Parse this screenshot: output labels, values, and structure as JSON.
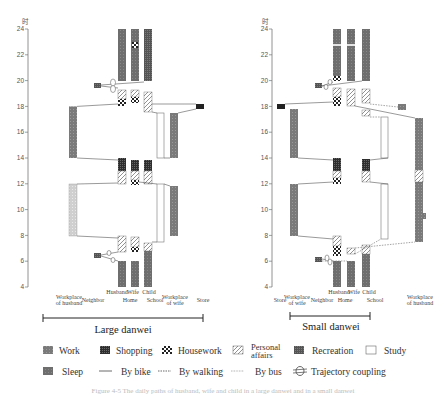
{
  "y_axis": {
    "unit_label": "时",
    "ticks": [
      24,
      22,
      20,
      18,
      16,
      14,
      12,
      10,
      8,
      6,
      4
    ],
    "range": [
      4,
      24
    ]
  },
  "panels": [
    {
      "id": "large",
      "title": "Large danwei",
      "axis_x": 28,
      "locations": [
        {
          "label": "Workplace of husband",
          "lines": [
            "Workplace",
            "of husband"
          ],
          "x": 69
        },
        {
          "label": "Neighbor",
          "lines": [
            "Neighbor"
          ],
          "x": 93
        },
        {
          "label": "Home",
          "lines": [
            "Home"
          ],
          "x": 130
        },
        {
          "label": "School",
          "lines": [
            "School"
          ],
          "x": 155
        },
        {
          "label": "Workplace of wife",
          "lines": [
            "Workplace",
            "of wife"
          ],
          "x": 175
        },
        {
          "label": "Store",
          "lines": [
            "Store"
          ],
          "x": 203
        }
      ],
      "members": [
        {
          "label": "Husband",
          "x": 117
        },
        {
          "label": "Wife",
          "x": 133
        },
        {
          "label": "Child",
          "x": 149
        }
      ],
      "bracket": [
        43,
        203
      ]
    },
    {
      "id": "small",
      "title": "Small danwei",
      "axis_x": 272,
      "locations": [
        {
          "label": "Store",
          "lines": [
            "Store"
          ],
          "x": 280
        },
        {
          "label": "Workplace of wife",
          "lines": [
            "Workplace",
            "of wife"
          ],
          "x": 297
        },
        {
          "label": "Neighbor",
          "lines": [
            "Neighbor"
          ],
          "x": 322
        },
        {
          "label": "Home",
          "lines": [
            "Home"
          ],
          "x": 345
        },
        {
          "label": "School",
          "lines": [
            "School"
          ],
          "x": 375
        },
        {
          "label": "Workplace of husband",
          "lines": [
            "Workplace",
            "of husband"
          ],
          "x": 420
        }
      ],
      "members": [
        {
          "label": "Husband",
          "x": 339
        },
        {
          "label": "Wife",
          "x": 354
        },
        {
          "label": "Child",
          "x": 369
        }
      ],
      "bracket": [
        290,
        370
      ]
    }
  ],
  "legend": {
    "row1": [
      {
        "label": "Work",
        "type": "work"
      },
      {
        "label": "Shopping",
        "type": "shopping"
      },
      {
        "label": "Housework",
        "type": "housework"
      },
      {
        "label": "Personal affairs",
        "type": "personal",
        "lines": [
          "Personal",
          "affairs"
        ]
      },
      {
        "label": "Recreation",
        "type": "recreation"
      },
      {
        "label": "Study",
        "type": "study"
      }
    ],
    "row2": [
      {
        "label": "Sleep",
        "type": "sleep"
      },
      {
        "label": "By bike",
        "type": "bike"
      },
      {
        "label": "By walking",
        "type": "walking"
      },
      {
        "label": "By bus",
        "type": "bus"
      },
      {
        "label": "Trajectory coupling",
        "type": "coupling"
      }
    ]
  },
  "colors": {
    "sleep": "#6e6e6e",
    "work": "#777777",
    "shopping": "#3a3a3a",
    "recreation": "#5a5a5a",
    "study": "#ffffff",
    "line": "#555555",
    "text": "#333333"
  },
  "caption": "Figure 4-5  The daily paths of husband, wife and child in a large danwei and in a small danwei"
}
